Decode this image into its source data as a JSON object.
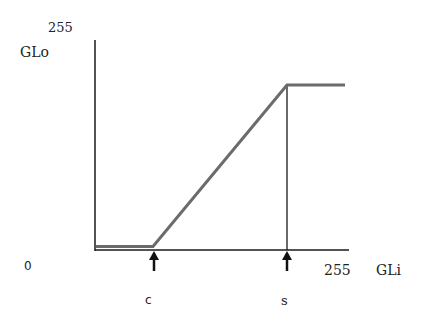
{
  "diagram": {
    "type": "transfer-function",
    "y_axis": {
      "label": "GLo",
      "max_label": "255"
    },
    "x_axis": {
      "label": "GLi",
      "min_label": "0",
      "max_label": "255"
    },
    "markers": [
      {
        "id": "c",
        "label": "c"
      },
      {
        "id": "s",
        "label": "s"
      }
    ],
    "colors": {
      "axes": "#1a1a1a",
      "curve": "#6b6b6b",
      "arrow": "#111111"
    }
  }
}
